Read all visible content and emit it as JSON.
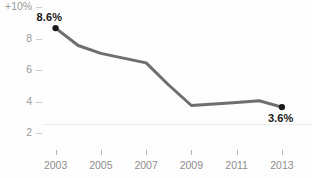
{
  "chart_data": {
    "type": "line",
    "title": "",
    "subtitle": "",
    "xlabel": "",
    "ylabel": "",
    "x": [
      2003,
      2004,
      2005,
      2006,
      2007,
      2008,
      2009,
      2010,
      2011,
      2012,
      2013
    ],
    "series": [
      {
        "name": "annual change",
        "values": [
          8.6,
          7.5,
          7.0,
          6.7,
          6.4,
          5.0,
          3.7,
          3.8,
          3.9,
          4.0,
          3.6
        ],
        "color": "#6e6e6e",
        "line_width": 3
      }
    ],
    "xlim": [
      2002.4,
      2013.8
    ],
    "ylim": [
      1.2,
      10.0
    ],
    "grid": false,
    "legend": false,
    "legend_position": "none",
    "y_ticks": [
      {
        "value": 10,
        "label": "+10%"
      },
      {
        "value": 8,
        "label": "8"
      },
      {
        "value": 6,
        "label": "6"
      },
      {
        "value": 4,
        "label": "4"
      },
      {
        "value": 2,
        "label": "2"
      }
    ],
    "y_tick_dash": "–",
    "x_ticks": [
      {
        "value": 2003,
        "label": "2003"
      },
      {
        "value": 2005,
        "label": "2005"
      },
      {
        "value": 2007,
        "label": "2007"
      },
      {
        "value": 2009,
        "label": "2009"
      },
      {
        "value": 2011,
        "label": "2011"
      },
      {
        "value": 2013,
        "label": "2013"
      }
    ],
    "annotations": [
      {
        "name": "first-point-label",
        "x": 2003,
        "y": 8.6,
        "text": "8.6%",
        "position": "above-right"
      },
      {
        "name": "last-point-label",
        "x": 2013,
        "y": 3.6,
        "text": "3.6%",
        "position": "below-left"
      }
    ],
    "endpoint_markers": [
      {
        "x": 2003,
        "y": 8.6
      },
      {
        "x": 2013,
        "y": 3.6
      }
    ],
    "colors": {
      "line": "#6e6e6e",
      "marker": "#1a1a1a",
      "axis_text": "#909090",
      "label_text": "#1a1a1a",
      "rule": "#ececec",
      "background": "#fdfdfd"
    }
  },
  "top_clipped_text": ""
}
